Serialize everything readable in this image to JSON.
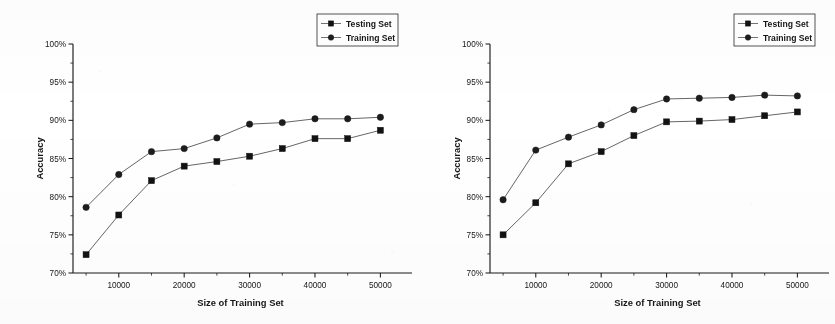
{
  "figure": {
    "background": "#ffffff",
    "ink_color": "#161616",
    "line_color": "#4a4a4a",
    "panel_count": 2
  },
  "chart_data": [
    {
      "type": "line",
      "panel_index": 0,
      "title": "",
      "xlabel": "Size of Training Set",
      "ylabel": "Accuracy",
      "x": [
        5000,
        10000,
        15000,
        20000,
        25000,
        30000,
        35000,
        40000,
        45000,
        50000
      ],
      "xlim": [
        3000,
        53000
      ],
      "ylim": [
        70,
        100
      ],
      "xticks": [
        10000,
        20000,
        30000,
        40000,
        50000
      ],
      "xticklabels": [
        "10000",
        "20000",
        "30000",
        "40000",
        "50000"
      ],
      "yticks": [
        70,
        75,
        80,
        85,
        90,
        95,
        100
      ],
      "yticklabels": [
        "70%",
        "75%",
        "80%",
        "85%",
        "90%",
        "95%",
        "100%"
      ],
      "grid": false,
      "legend_position": "top-right",
      "series": [
        {
          "name": "Testing Set",
          "marker": "square",
          "values": [
            72.4,
            77.6,
            82.1,
            84.0,
            84.6,
            85.3,
            86.3,
            87.6,
            87.6,
            88.7
          ]
        },
        {
          "name": "Training Set",
          "marker": "circle",
          "values": [
            78.6,
            82.9,
            85.9,
            86.3,
            87.7,
            89.5,
            89.7,
            90.2,
            90.2,
            90.4
          ]
        }
      ]
    },
    {
      "type": "line",
      "panel_index": 1,
      "title": "",
      "xlabel": "Size of Training Set",
      "ylabel": "Accuracy",
      "x": [
        5000,
        10000,
        15000,
        20000,
        25000,
        30000,
        35000,
        40000,
        45000,
        50000
      ],
      "xlim": [
        3000,
        53000
      ],
      "ylim": [
        70,
        100
      ],
      "xticks": [
        10000,
        20000,
        30000,
        40000,
        50000
      ],
      "xticklabels": [
        "10000",
        "20000",
        "30000",
        "40000",
        "50000"
      ],
      "yticks": [
        70,
        75,
        80,
        85,
        90,
        95,
        100
      ],
      "yticklabels": [
        "70%",
        "75%",
        "80%",
        "85%",
        "90%",
        "95%",
        "100%"
      ],
      "grid": false,
      "legend_position": "top-right",
      "series": [
        {
          "name": "Testing Set",
          "marker": "square",
          "values": [
            75.0,
            79.2,
            84.3,
            85.9,
            88.0,
            89.8,
            89.9,
            90.1,
            90.6,
            91.1
          ]
        },
        {
          "name": "Training Set",
          "marker": "circle",
          "values": [
            79.6,
            86.1,
            87.8,
            89.4,
            91.4,
            92.8,
            92.9,
            93.0,
            93.3,
            93.2
          ]
        }
      ]
    }
  ]
}
